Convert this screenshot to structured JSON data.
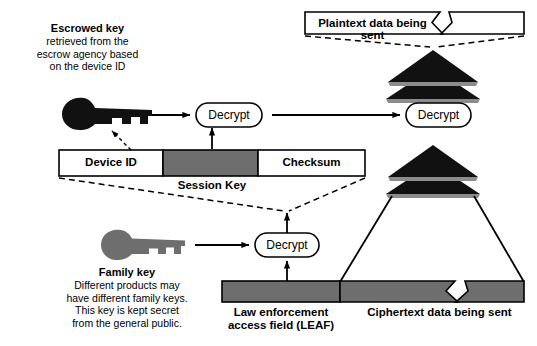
{
  "diagram": {
    "colors": {
      "stroke": "#000000",
      "gray_fill": "#6e6e6e",
      "white_fill": "#ffffff",
      "black_fill": "#111111",
      "key_gray": "#6e6e6e"
    }
  },
  "escrowed_key_note": {
    "heading": "Escrowed key",
    "line1": "retrieved from the",
    "line2": "escrow agency based",
    "line3": "on the device ID"
  },
  "family_key_note": {
    "heading": "Family key",
    "line1": "Different products may",
    "line2": "have different family keys.",
    "line3": "This key is kept secret",
    "line4": "from the general public."
  },
  "session_key_bar": {
    "caption": "Session Key",
    "segments": [
      {
        "label": "Device ID",
        "fill": "white"
      },
      {
        "label": "",
        "fill": "gray"
      },
      {
        "label": "Checksum",
        "fill": "white"
      }
    ]
  },
  "bottom_bar": {
    "leaf_label_line1": "Law enforcement",
    "leaf_label_line2": "access field (LEAF)",
    "ciphertext_label": "Ciphertext data being sent",
    "segments": [
      {
        "name": "leaf",
        "fill": "gray"
      },
      {
        "name": "ciphertext",
        "fill": "gray"
      }
    ]
  },
  "plaintext_bar": {
    "label": "Plaintext data being sent",
    "fill": "white"
  },
  "decrypt_nodes": [
    {
      "id": "decrypt-session",
      "label": "Decrypt"
    },
    {
      "id": "decrypt-plaintext",
      "label": "Decrypt"
    },
    {
      "id": "decrypt-leaf",
      "label": "Decrypt"
    }
  ],
  "icons": {
    "escrowed_key": "key-icon",
    "family_key": "key-icon"
  }
}
